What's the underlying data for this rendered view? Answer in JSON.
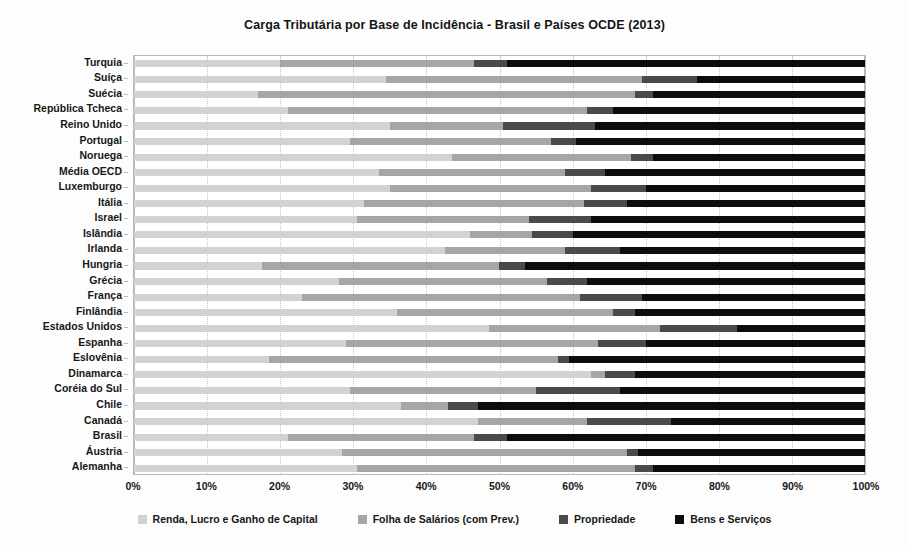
{
  "chart_data": {
    "type": "bar",
    "orientation": "horizontal",
    "stacked": true,
    "normalized": true,
    "title": "Carga Tributária por Base de Incidência - Brasil e Países OCDE (2013)",
    "xlabel": "",
    "ylabel": "",
    "xlim": [
      0,
      100
    ],
    "xticks": [
      "0%",
      "10%",
      "20%",
      "30%",
      "40%",
      "50%",
      "60%",
      "70%",
      "80%",
      "90%",
      "100%"
    ],
    "xtick_values": [
      0,
      10,
      20,
      30,
      40,
      50,
      60,
      70,
      80,
      90,
      100
    ],
    "grid": true,
    "legend_position": "bottom",
    "series": [
      {
        "name": "Renda, Lucro e Ganho de Capital",
        "color": "#d2d2d2"
      },
      {
        "name": "Folha de Salários (com Prev.)",
        "color": "#a6a6a6"
      },
      {
        "name": "Propriedade",
        "color": "#4a4a4a"
      },
      {
        "name": "Bens e Serviços",
        "color": "#0d0d0d"
      }
    ],
    "categories": [
      "Turquia",
      "Suíça",
      "Suécia",
      "República Tcheca",
      "Reino Unido",
      "Portugal",
      "Noruega",
      "Média OECD",
      "Luxemburgo",
      "Itália",
      "Israel",
      "Islândia",
      "Irlanda",
      "Hungria",
      "Grécia",
      "França",
      "Finlândia",
      "Estados Unidos",
      "Espanha",
      "Eslovênia",
      "Dinamarca",
      "Coréia do Sul",
      "Chile",
      "Canadá",
      "Brasil",
      "Áustria",
      "Alemanha"
    ],
    "values": [
      [
        20.0,
        26.5,
        4.5,
        49.0
      ],
      [
        34.5,
        35.0,
        7.5,
        23.0
      ],
      [
        17.0,
        51.5,
        2.5,
        29.0
      ],
      [
        21.0,
        41.0,
        3.5,
        34.5
      ],
      [
        35.0,
        15.5,
        12.5,
        37.0
      ],
      [
        29.5,
        27.5,
        3.5,
        39.5
      ],
      [
        43.5,
        24.5,
        3.0,
        29.0
      ],
      [
        33.5,
        25.5,
        5.5,
        35.5
      ],
      [
        35.0,
        27.5,
        7.5,
        30.0
      ],
      [
        31.5,
        30.0,
        6.0,
        32.5
      ],
      [
        30.5,
        23.5,
        8.5,
        37.5
      ],
      [
        46.0,
        8.5,
        5.5,
        40.0
      ],
      [
        42.5,
        16.5,
        7.5,
        33.5
      ],
      [
        17.5,
        32.5,
        3.5,
        46.5
      ],
      [
        28.0,
        28.5,
        5.5,
        38.0
      ],
      [
        23.0,
        38.0,
        8.5,
        30.5
      ],
      [
        36.0,
        29.5,
        3.0,
        31.5
      ],
      [
        48.5,
        23.5,
        10.5,
        17.5
      ],
      [
        29.0,
        34.5,
        6.5,
        30.0
      ],
      [
        18.5,
        39.5,
        1.5,
        40.5
      ],
      [
        62.5,
        2.0,
        4.0,
        31.5
      ],
      [
        29.5,
        25.5,
        11.5,
        33.5
      ],
      [
        36.5,
        6.5,
        4.0,
        53.0
      ],
      [
        47.0,
        15.0,
        11.5,
        26.5
      ],
      [
        21.0,
        25.5,
        4.5,
        49.0
      ],
      [
        28.5,
        39.0,
        1.5,
        31.0
      ],
      [
        30.5,
        38.0,
        2.5,
        29.0
      ]
    ]
  }
}
